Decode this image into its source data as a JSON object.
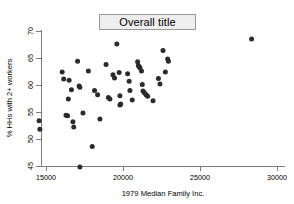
{
  "title": {
    "text": "Overall title"
  },
  "axes": {
    "x_label": "1979 Median Family Inc.",
    "y_label": "% HHs with 2+ workers",
    "x_ticks": [
      "15000",
      "20000",
      "25000",
      "30000"
    ],
    "y_ticks": [
      "45",
      "50",
      "55",
      "60",
      "65",
      "70"
    ]
  },
  "colors": {
    "marker": "#2b2b2b",
    "axis": "#6f6f6f",
    "title_box_fill": "#eeeeee",
    "title_box_border": "#9a9a9a",
    "background": "#ffffff"
  },
  "chart_data": {
    "type": "scatter",
    "title": "Overall title",
    "xlabel": "1979 Median Family Inc.",
    "ylabel": "% HHs with 2+ workers",
    "xlim": [
      14000,
      30500
    ],
    "ylim": [
      44,
      70.5
    ],
    "xticks": [
      15000,
      20000,
      25000,
      30000
    ],
    "yticks": [
      45,
      50,
      55,
      60,
      65,
      70
    ],
    "grid": false,
    "legend": null,
    "series": [
      {
        "name": "states",
        "points": [
          [
            14550,
            53.4
          ],
          [
            14600,
            51.8
          ],
          [
            16050,
            62.4
          ],
          [
            16150,
            61.1
          ],
          [
            16300,
            54.4
          ],
          [
            16400,
            54.3
          ],
          [
            16450,
            57.4
          ],
          [
            16500,
            60.9
          ],
          [
            16650,
            59.1
          ],
          [
            16750,
            53.2
          ],
          [
            16800,
            52.2
          ],
          [
            17050,
            64.4
          ],
          [
            17150,
            59.8
          ],
          [
            17200,
            59.6
          ],
          [
            17200,
            44.8
          ],
          [
            17400,
            54.8
          ],
          [
            17750,
            62.6
          ],
          [
            18000,
            48.6
          ],
          [
            18150,
            59.0
          ],
          [
            18350,
            58.2
          ],
          [
            18500,
            53.7
          ],
          [
            18900,
            63.8
          ],
          [
            19050,
            57.7
          ],
          [
            19150,
            57.4
          ],
          [
            19350,
            61.9
          ],
          [
            19450,
            61.3
          ],
          [
            19600,
            67.6
          ],
          [
            19750,
            62.3
          ],
          [
            19800,
            58.0
          ],
          [
            19800,
            56.3
          ],
          [
            19850,
            56.5
          ],
          [
            20300,
            62.1
          ],
          [
            20400,
            60.7
          ],
          [
            20450,
            59.0
          ],
          [
            20600,
            57.2
          ],
          [
            20950,
            64.3
          ],
          [
            21000,
            63.6
          ],
          [
            21050,
            63.4
          ],
          [
            21100,
            63.2
          ],
          [
            21200,
            62.6
          ],
          [
            21250,
            60.1
          ],
          [
            21300,
            58.9
          ],
          [
            21400,
            58.5
          ],
          [
            21500,
            58.2
          ],
          [
            21600,
            57.9
          ],
          [
            21950,
            57.1
          ],
          [
            22300,
            61.2
          ],
          [
            22400,
            60.2
          ],
          [
            22600,
            66.4
          ],
          [
            22750,
            62.4
          ],
          [
            22900,
            64.8
          ],
          [
            22950,
            64.4
          ],
          [
            28350,
            68.5
          ]
        ]
      }
    ]
  }
}
